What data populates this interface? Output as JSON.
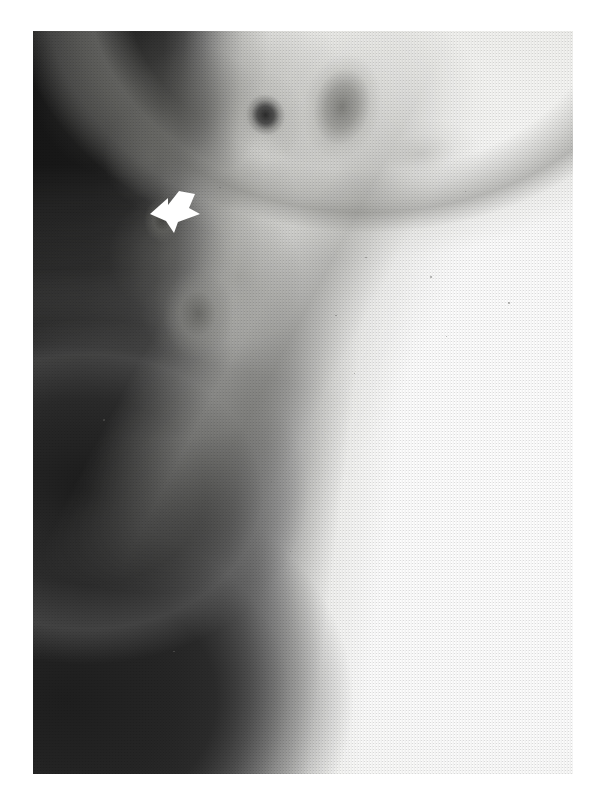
{
  "figure": {
    "kind": "radiograph",
    "modality": "x-ray",
    "orientation": "lateral",
    "print_style": "halftone",
    "page_background": "#ffffff",
    "plate": {
      "left": 33,
      "top": 31,
      "width": 540,
      "height": 743,
      "dark_side": "left",
      "bright_side": "right"
    },
    "annotations": [
      {
        "type": "arrow",
        "icon": "arrow-pointer-icon",
        "color": "#ffffff",
        "direction": "left-down",
        "x": 148,
        "y": 188,
        "width": 56,
        "height": 48,
        "label": ""
      }
    ],
    "regions": [
      {
        "name": "air-background",
        "tone": "dark",
        "position": "left"
      },
      {
        "name": "skin-contour-line",
        "tone": "gradient",
        "position": "left-center"
      },
      {
        "name": "dense-tissue-field",
        "tone": "bright",
        "position": "right"
      },
      {
        "name": "nodular-opacity",
        "tone": "dark-focal",
        "position": "upper-center"
      },
      {
        "name": "diffuse-opacity",
        "tone": "dark-diffuse",
        "position": "upper-right"
      },
      {
        "name": "curvilinear-margin",
        "tone": "mid",
        "position": "upper-third"
      }
    ],
    "speckles": [
      {
        "x": 13.0,
        "y": 52.2,
        "r": 0.9
      },
      {
        "x": 61.5,
        "y": 30.4,
        "r": 0.8
      },
      {
        "x": 56.0,
        "y": 38.2,
        "r": 0.7
      },
      {
        "x": 73.6,
        "y": 33.0,
        "r": 0.7
      },
      {
        "x": 88.0,
        "y": 36.5,
        "r": 0.8
      },
      {
        "x": 59.4,
        "y": 46.0,
        "r": 0.8
      },
      {
        "x": 76.5,
        "y": 41.0,
        "r": 0.6
      },
      {
        "x": 44.0,
        "y": 60.5,
        "r": 0.7
      },
      {
        "x": 26.0,
        "y": 83.4,
        "r": 0.7
      },
      {
        "x": 34.5,
        "y": 21.0,
        "r": 0.7
      },
      {
        "x": 80.0,
        "y": 21.5,
        "r": 0.6
      },
      {
        "x": 47.5,
        "y": 70.0,
        "r": 0.6
      }
    ]
  }
}
